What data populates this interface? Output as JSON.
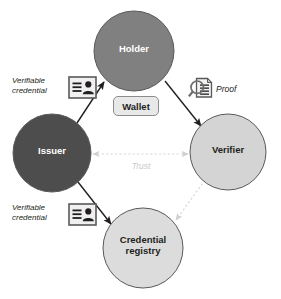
{
  "diagram": {
    "background": "#ffffff",
    "colors": {
      "issuer_fill": "#4d4d4d",
      "holder_fill": "#808080",
      "verifier_fill": "#d4d4d4",
      "registry_fill": "#dcdcdc",
      "wallet_fill": "#e8e8e8",
      "node_stroke": "#58595b",
      "arrow_dark": "#231f20",
      "arrow_light": "#d8d8d8",
      "text_light": "#ffffff",
      "text_dark": "#231f20",
      "trust_text": "#c9c9c9"
    },
    "nodes": [
      {
        "id": "holder",
        "label": "Holder",
        "fill": "#808080",
        "text_color": "#ffffff",
        "cx": 134,
        "cy": 51,
        "r": 40,
        "font_size": 10
      },
      {
        "id": "issuer",
        "label": "Issuer",
        "fill": "#4d4d4d",
        "text_color": "#ffffff",
        "cx": 52,
        "cy": 153,
        "r": 39,
        "font_size": 10
      },
      {
        "id": "verifier",
        "label": "Verifier",
        "fill": "#d4d4d4",
        "text_color": "#231f20",
        "cx": 228,
        "cy": 152,
        "r": 38,
        "font_size": 10
      },
      {
        "id": "credential-registry",
        "label": "Credential\nregistry",
        "fill": "#dcdcdc",
        "text_color": "#231f20",
        "cx": 143,
        "cy": 248,
        "r": 40,
        "font_size": 10
      }
    ],
    "wallet": {
      "label": "Wallet",
      "fill": "#e8e8e8",
      "stroke": "#8c8c8c",
      "text_color": "#231f20",
      "font_size": 10,
      "x": 113,
      "y": 96,
      "width": 44,
      "height": 18
    },
    "edges": [
      {
        "id": "issuer-to-holder",
        "from": "issuer",
        "to": "holder",
        "style": "solid",
        "color": "#231f20",
        "arrow": "single",
        "label": "Verifiable\ncredential",
        "icon": "id-card-icon"
      },
      {
        "id": "holder-to-verifier",
        "from": "holder",
        "to": "verifier",
        "style": "solid",
        "color": "#231f20",
        "arrow": "single",
        "label": "Proof",
        "icon": "proof-magnifier-icon"
      },
      {
        "id": "issuer-to-registry",
        "from": "issuer",
        "to": "credential-registry",
        "style": "solid",
        "color": "#231f20",
        "arrow": "single",
        "label": "Verifiable\ncredential",
        "icon": "id-card-icon"
      },
      {
        "id": "issuer-verifier-trust",
        "from": "issuer",
        "to": "verifier",
        "style": "dashed",
        "color": "#d8d8d8",
        "arrow": "double",
        "label": "Trust",
        "icon": null
      },
      {
        "id": "verifier-to-registry",
        "from": "verifier",
        "to": "credential-registry",
        "style": "dashed",
        "color": "#d8d8d8",
        "arrow": "single",
        "label": "",
        "icon": null
      }
    ],
    "labels": {
      "verifiable_credential_top": "Verifiable\ncredential",
      "verifiable_credential_bottom": "Verifiable\ncredential",
      "proof": "Proof",
      "trust": "Trust"
    }
  }
}
